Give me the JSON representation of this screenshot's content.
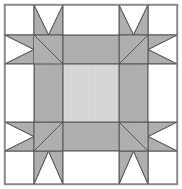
{
  "figure": {
    "width": 182,
    "height": 189
  },
  "colors": {
    "background": "#ffffff",
    "patch_light": "#ffffff",
    "patch_medium": "#b0b0b0",
    "patch_center": "#d8d8d8",
    "seam_line": "#555555",
    "outer_border": "#8a8a8a"
  },
  "geometry": {
    "border_inset": 4.5,
    "grid_columns": 6,
    "grid_rows": 6,
    "x_stops": [
      5,
      34,
      63,
      92,
      121,
      150,
      177
    ],
    "y_stops": [
      5,
      35,
      64,
      93,
      122,
      151,
      184
    ],
    "seam_width": 1
  },
  "patches": {
    "corner_units": [
      {
        "name": "top-left",
        "rotation": 0
      },
      {
        "name": "top-right",
        "rotation": 90
      },
      {
        "name": "bottom-right",
        "rotation": 180
      },
      {
        "name": "bottom-left",
        "rotation": 270
      }
    ],
    "sashing_bars": [
      {
        "name": "top-sashing",
        "fill": "medium"
      },
      {
        "name": "right-sashing",
        "fill": "medium"
      },
      {
        "name": "bottom-sashing",
        "fill": "medium"
      },
      {
        "name": "left-sashing",
        "fill": "medium"
      }
    ],
    "center": {
      "name": "center-square",
      "fill": "center"
    }
  }
}
